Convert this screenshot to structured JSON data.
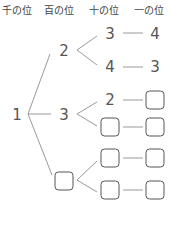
{
  "headers": [
    "千の位",
    "百の位",
    "十の位",
    "一の位"
  ],
  "tree": {
    "thousands": "1",
    "hundreds": [
      "2",
      "3",
      ""
    ],
    "rows": [
      {
        "tens": "3",
        "ones": "4"
      },
      {
        "tens": "4",
        "ones": "3"
      },
      {
        "tens": "2",
        "ones": ""
      },
      {
        "tens": "",
        "ones": ""
      },
      {
        "tens": "",
        "ones": ""
      },
      {
        "tens": "",
        "ones": ""
      }
    ]
  },
  "line_color": "#999999"
}
